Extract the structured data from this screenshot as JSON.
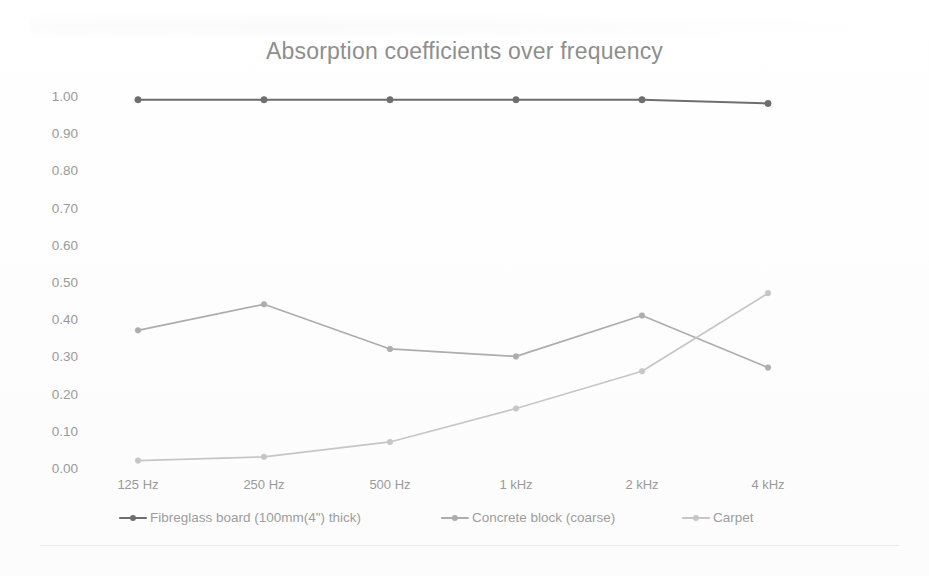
{
  "chart_data": {
    "type": "line",
    "title": "Absorption coefficients over frequency",
    "xlabel": "",
    "ylabel": "",
    "categories": [
      "125 Hz",
      "250 Hz",
      "500 Hz",
      "1 kHz",
      "2 kHz",
      "4 kHz"
    ],
    "ylim": [
      0.0,
      1.0
    ],
    "ytick_labels": [
      "1.00",
      "0.90",
      "0.80",
      "0.70",
      "0.60",
      "0.50",
      "0.40",
      "0.30",
      "0.20",
      "0.10",
      "0.00"
    ],
    "ytick_values": [
      1.0,
      0.9,
      0.8,
      0.7,
      0.6,
      0.5,
      0.4,
      0.3,
      0.2,
      0.1,
      0.0
    ],
    "grid": false,
    "legend_position": "bottom",
    "series": [
      {
        "name": "Fibreglass board (100mm(4\") thick)",
        "color": "#6e6e6e",
        "values": [
          0.99,
          0.99,
          0.99,
          0.99,
          0.99,
          0.98
        ]
      },
      {
        "name": "Concrete block (coarse)",
        "color": "#adadad",
        "values": [
          0.37,
          0.44,
          0.32,
          0.3,
          0.41,
          0.27
        ]
      },
      {
        "name": "Carpet",
        "color": "#c6c6c6",
        "values": [
          0.02,
          0.03,
          0.07,
          0.16,
          0.26,
          0.47
        ]
      }
    ]
  }
}
